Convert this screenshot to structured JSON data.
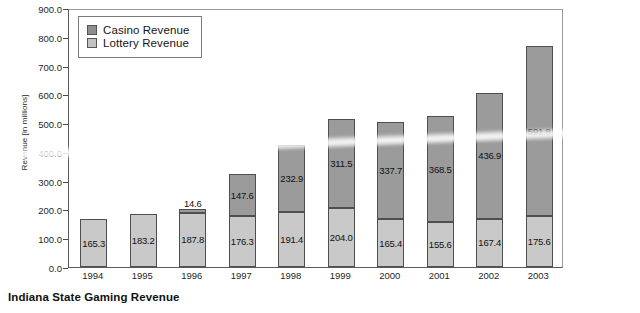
{
  "caption": "Indiana State Gaming Revenue",
  "legend": {
    "casino_label": "Casino Revenue",
    "lottery_label": "Lottery Revenue",
    "casino_color": "#8e8e8e",
    "lottery_color": "#c2c2c2"
  },
  "chart_data": {
    "type": "bar",
    "stacked": true,
    "title": "Indiana State Gaming Revenue",
    "xlabel": "",
    "ylabel": "Revenue [in millions]",
    "ylim": [
      0,
      900
    ],
    "ytick_step": 100,
    "grid": false,
    "legend_position": "top-left",
    "categories": [
      "1994",
      "1995",
      "1996",
      "1997",
      "1998",
      "1999",
      "2000",
      "2001",
      "2002",
      "2003"
    ],
    "ytick_labels": [
      "0.0",
      "100.0",
      "200.0",
      "300.0",
      "400.0",
      "500.0",
      "600.0",
      "700.0",
      "800.0",
      "900.0"
    ],
    "series": [
      {
        "name": "Lottery Revenue",
        "color": "#c9c9c9",
        "values": [
          165.3,
          183.2,
          187.8,
          176.3,
          191.4,
          204.0,
          165.4,
          155.6,
          167.4,
          175.6
        ],
        "labels": [
          "165.3",
          "183.2",
          "187.8",
          "176.3",
          "191.4",
          "204.0",
          "165.4",
          "155.6",
          "167.4",
          "175.6"
        ]
      },
      {
        "name": "Casino Revenue",
        "color": "#9b9b9b",
        "values": [
          0,
          0,
          14.6,
          147.6,
          232.9,
          311.5,
          337.7,
          368.5,
          436.9,
          591.8
        ],
        "labels": [
          "",
          "",
          "14.6",
          "147.6",
          "232.9",
          "311.5",
          "337.7",
          "368.5",
          "436.9",
          "591.8"
        ]
      }
    ],
    "totals": [
      165.3,
      183.2,
      202.4,
      323.9,
      424.3,
      515.5,
      503.1,
      524.1,
      604.3,
      767.4
    ]
  }
}
